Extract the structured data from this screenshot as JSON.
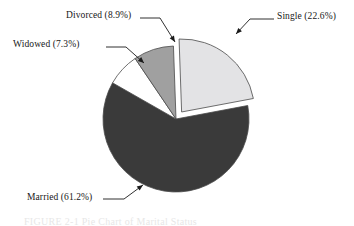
{
  "figure": {
    "caption": "FIGURE 2-1   Pie Chart of Marital Status",
    "background_color": "#ffffff"
  },
  "chart_data": {
    "type": "pie",
    "title": "",
    "xlabel": "",
    "ylabel": "",
    "legend_position": "none",
    "grid": false,
    "labels_outside": true,
    "start_angle_deg": -2,
    "direction": "clockwise",
    "center": {
      "x": 176,
      "y": 119
    },
    "radius": 73,
    "categories": [
      "Single",
      "Married",
      "Widowed",
      "Divorced"
    ],
    "values": [
      22.6,
      61.2,
      7.3,
      8.9
    ],
    "units": "percent",
    "slices": [
      {
        "name": "Single",
        "value": 22.6,
        "label": "Single (22.6%)",
        "color": "#e3e3e5",
        "edge_color": "#4a4a4a",
        "exploded": true,
        "explode_offset": 9
      },
      {
        "name": "Married",
        "value": 61.2,
        "label": "Married (61.2%)",
        "color": "#3a3a3a",
        "edge_color": "#4a4a4a",
        "exploded": false,
        "explode_offset": 0
      },
      {
        "name": "Widowed",
        "value": 7.3,
        "label": "Widowed (7.3%)",
        "color": "#ffffff",
        "edge_color": "#4a4a4a",
        "exploded": false,
        "explode_offset": 0
      },
      {
        "name": "Divorced",
        "value": 8.9,
        "label": "Divorced (8.9%)",
        "color": "#a0a0a0",
        "edge_color": "#4a4a4a",
        "exploded": false,
        "explode_offset": 0
      }
    ],
    "leader_lines": [
      {
        "name": "Single",
        "polyline": "274,19 250,19 236,34",
        "arrow_at": {
          "x": 236,
          "y": 34
        },
        "arrow_angle_deg": 133
      },
      {
        "name": "Divorced",
        "polyline": "140,18 160,18 175,42",
        "arrow_at": {
          "x": 175,
          "y": 42
        },
        "arrow_angle_deg": 58
      },
      {
        "name": "Widowed",
        "polyline": "106,47 126,47 144,63",
        "arrow_at": {
          "x": 144,
          "y": 63
        },
        "arrow_angle_deg": 42
      },
      {
        "name": "Married",
        "polyline": "103,199 124,199 143,185",
        "arrow_at": {
          "x": 143,
          "y": 185
        },
        "arrow_angle_deg": -36
      }
    ]
  }
}
